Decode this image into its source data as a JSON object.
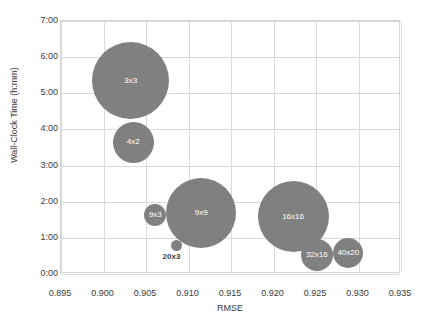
{
  "chart_data": {
    "type": "scatter",
    "title": "",
    "xlabel": "RMSE",
    "ylabel": "Wall-Clock Time (h:mm)",
    "xlim": [
      0.895,
      0.935
    ],
    "ylim": [
      0,
      7
    ],
    "grid": true,
    "legend": false,
    "bubble_color": "#808080",
    "x_ticks": [
      "0.895",
      "0.900",
      "0.905",
      "0.910",
      "0.915",
      "0.920",
      "0.925",
      "0.930",
      "0.935"
    ],
    "x_tick_values": [
      0.895,
      0.9,
      0.905,
      0.91,
      0.915,
      0.92,
      0.925,
      0.93,
      0.935
    ],
    "y_ticks": [
      "0:00",
      "1:00",
      "2:00",
      "3:00",
      "4:00",
      "5:00",
      "6:00",
      "7:00"
    ],
    "y_tick_values": [
      0,
      1,
      2,
      3,
      4,
      5,
      6,
      7
    ],
    "points": [
      {
        "label": "3x3",
        "x": 0.9032,
        "y": 5.34,
        "size": 38.5,
        "label_inside": true
      },
      {
        "label": "4x2",
        "x": 0.9035,
        "y": 3.64,
        "size": 20.6,
        "label_inside": true
      },
      {
        "label": "9x3",
        "x": 0.9061,
        "y": 1.63,
        "size": 11.0,
        "label_inside": true
      },
      {
        "label": "9x9",
        "x": 0.9115,
        "y": 1.69,
        "size": 35.0,
        "label_inside": true
      },
      {
        "label": "20x3",
        "x": 0.9086,
        "y": 0.79,
        "size": 5.4,
        "label_inside": false
      },
      {
        "label": "16x16",
        "x": 0.9223,
        "y": 1.58,
        "size": 35.5,
        "label_inside": true
      },
      {
        "label": "32x16",
        "x": 0.9251,
        "y": 0.53,
        "size": 16.0,
        "label_inside": true
      },
      {
        "label": "40x20",
        "x": 0.9288,
        "y": 0.58,
        "size": 15.0,
        "label_inside": true
      }
    ]
  }
}
